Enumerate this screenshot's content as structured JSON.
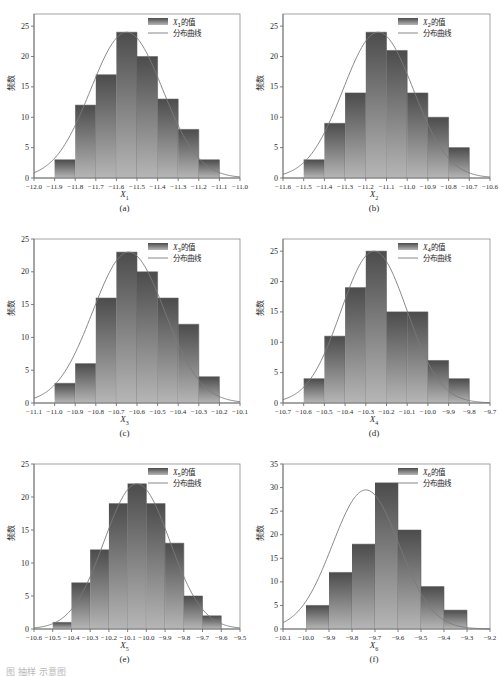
{
  "figure": {
    "ylabel_text": "频数",
    "legend_bar_label_suffix": "的值",
    "legend_curve_label": "分布曲线",
    "bottom_caption": "图        抽样      示意图",
    "bar_color_top": "#4c4c4c",
    "bar_color_bottom": "#b6b6b6",
    "curve_color": "#7a7a7a",
    "axis_color": "#6f6f6f"
  },
  "chart_data": [
    {
      "type": "bar",
      "panel": "(a)",
      "title": "",
      "xlabel": "X",
      "xlabel_sub": "1",
      "ylabel": "频数",
      "legend": [
        "X₁的值",
        "分布曲线"
      ],
      "legend_series_label": "X",
      "legend_series_sub": "1",
      "grid": false,
      "legend_position": "top-right",
      "xticks": [
        "−12.0",
        "−11.9",
        "−11.8",
        "−11.7",
        "−11.6",
        "−11.5",
        "−11.4",
        "−11.3",
        "−11.2",
        "−11.1",
        "−11.0"
      ],
      "yticks": [
        0,
        5,
        10,
        15,
        20,
        25
      ],
      "ylim": [
        0,
        27
      ],
      "bin_edges": [
        -12.0,
        -11.9,
        -11.8,
        -11.7,
        -11.6,
        -11.5,
        -11.4,
        -11.3,
        -11.2,
        -11.1,
        -11.0
      ],
      "values": [
        3,
        12,
        17,
        24,
        20,
        13,
        8,
        3
      ],
      "bar_start_index": 1,
      "curve_peak_index": 4.5,
      "curve_peak_value": 24,
      "curve_sigma_bins": 1.75
    },
    {
      "type": "bar",
      "panel": "(b)",
      "title": "",
      "xlabel": "X",
      "xlabel_sub": "2",
      "ylabel": "频数",
      "legend": [
        "X₂的值",
        "分布曲线"
      ],
      "legend_series_label": "X",
      "legend_series_sub": "2",
      "grid": false,
      "legend_position": "top-right",
      "xticks": [
        "−11.6",
        "−11.5",
        "−11.4",
        "−11.3",
        "−11.2",
        "−11.1",
        "−11.0",
        "−10.9",
        "−10.8",
        "−10.7",
        "−10.6"
      ],
      "yticks": [
        0,
        5,
        10,
        15,
        20,
        25
      ],
      "ylim": [
        0,
        27
      ],
      "bin_edges": [
        -11.6,
        -11.5,
        -11.4,
        -11.3,
        -11.2,
        -11.1,
        -11.0,
        -10.9,
        -10.8,
        -10.7,
        -10.6
      ],
      "values": [
        3,
        9,
        14,
        24,
        21,
        14,
        10,
        5
      ],
      "bar_start_index": 1,
      "curve_peak_index": 4.6,
      "curve_peak_value": 24,
      "curve_sigma_bins": 1.7
    },
    {
      "type": "bar",
      "panel": "(c)",
      "title": "",
      "xlabel": "X",
      "xlabel_sub": "3",
      "ylabel": "频数",
      "legend": [
        "X₃的值",
        "分布曲线"
      ],
      "legend_series_label": "X",
      "legend_series_sub": "3",
      "grid": false,
      "legend_position": "top-right",
      "xticks": [
        "−11.1",
        "−11.0",
        "−10.9",
        "−10.8",
        "−10.7",
        "−10.6",
        "−10.5",
        "−10.4",
        "−10.3",
        "−10.2",
        "−10.1"
      ],
      "yticks": [
        0,
        5,
        10,
        15,
        20,
        25
      ],
      "ylim": [
        0,
        25
      ],
      "bin_edges": [
        -11.1,
        -11.0,
        -10.9,
        -10.8,
        -10.7,
        -10.6,
        -10.5,
        -10.4,
        -10.3,
        -10.2,
        -10.1
      ],
      "values": [
        3,
        6,
        16,
        23,
        20,
        16,
        12,
        4
      ],
      "bar_start_index": 1,
      "curve_peak_index": 4.6,
      "curve_peak_value": 23,
      "curve_sigma_bins": 1.75
    },
    {
      "type": "bar",
      "panel": "(d)",
      "title": "",
      "xlabel": "X",
      "xlabel_sub": "4",
      "ylabel": "频数",
      "legend": [
        "X₄的值",
        "分布曲线"
      ],
      "legend_series_label": "X",
      "legend_series_sub": "4",
      "grid": false,
      "legend_position": "top-right",
      "xticks": [
        "−10.7",
        "−10.6",
        "−10.5",
        "−10.4",
        "−10.3",
        "−10.2",
        "−10.1",
        "−10.0",
        "−9.9",
        "−9.8",
        "−9.7"
      ],
      "yticks": [
        0,
        5,
        10,
        15,
        20,
        25
      ],
      "ylim": [
        0,
        27
      ],
      "bin_edges": [
        -10.7,
        -10.6,
        -10.5,
        -10.4,
        -10.3,
        -10.2,
        -10.1,
        -10.0,
        -9.9,
        -9.8,
        -9.7
      ],
      "values": [
        4,
        11,
        19,
        25,
        15,
        15,
        7,
        4
      ],
      "bar_start_index": 1,
      "curve_peak_index": 4.4,
      "curve_peak_value": 25,
      "curve_sigma_bins": 1.6
    },
    {
      "type": "bar",
      "panel": "(e)",
      "title": "",
      "xlabel": "X",
      "xlabel_sub": "5",
      "ylabel": "频数",
      "legend": [
        "X₅的值",
        "分布曲线"
      ],
      "legend_series_label": "X",
      "legend_series_sub": "5",
      "grid": false,
      "legend_position": "top-right",
      "xticks": [
        "−10.6",
        "−10.5",
        "−10.4",
        "−10.3",
        "−10.2",
        "−10.1",
        "−10.0",
        "−9.9",
        "−9.8",
        "−9.7",
        "−9.6",
        "−9.5"
      ],
      "yticks": [
        0,
        5,
        10,
        15,
        20,
        25
      ],
      "ylim": [
        0,
        25
      ],
      "bin_edges": [
        -10.6,
        -10.5,
        -10.4,
        -10.3,
        -10.2,
        -10.1,
        -10.0,
        -9.9,
        -9.8,
        -9.7,
        -9.6,
        -9.5
      ],
      "values": [
        1,
        7,
        12,
        19,
        22,
        19,
        13,
        5,
        2
      ],
      "bar_start_index": 1,
      "curve_peak_index": 5.5,
      "curve_peak_value": 22,
      "curve_sigma_bins": 1.75
    },
    {
      "type": "bar",
      "panel": "(f)",
      "title": "",
      "xlabel": "X",
      "xlabel_sub": "6",
      "ylabel": "频数",
      "legend": [
        "X₆的值",
        "分布曲线"
      ],
      "legend_series_label": "X",
      "legend_series_sub": "6",
      "grid": false,
      "legend_position": "top-right",
      "xticks": [
        "−10.1",
        "−10.0",
        "−9.9",
        "−9.8",
        "−9.7",
        "−9.6",
        "−9.5",
        "−9.4",
        "−9.3",
        "−9.2"
      ],
      "yticks": [
        0,
        5,
        10,
        15,
        20,
        25,
        30,
        35
      ],
      "ylim": [
        0,
        35
      ],
      "bin_edges": [
        -10.1,
        -10.0,
        -9.9,
        -9.8,
        -9.7,
        -9.6,
        -9.5,
        -9.4,
        -9.3,
        -9.2
      ],
      "values": [
        5,
        12,
        18,
        31,
        21,
        9,
        4
      ],
      "bar_start_index": 1,
      "curve_peak_index": 3.6,
      "curve_peak_value": 29.5,
      "curve_sigma_bins": 1.45
    }
  ]
}
